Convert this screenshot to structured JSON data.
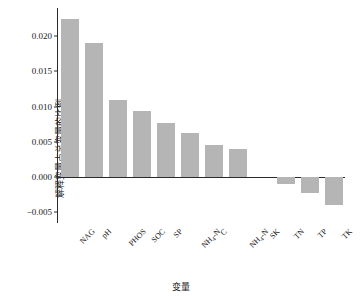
{
  "chart_data": {
    "type": "bar",
    "title": "",
    "xlabel": "变量",
    "ylabel": "解释变量占总变量的比例",
    "categories": [
      "NAG",
      "pH",
      "PHOS",
      "SOC",
      "SP",
      "NH4-N",
      "C",
      "NH4-N",
      "SK",
      "TN",
      "TP",
      "TK"
    ],
    "category_labels": [
      {
        "main": "NAG",
        "sub": ""
      },
      {
        "main": "pH",
        "sub": ""
      },
      {
        "main": "PHOS",
        "sub": ""
      },
      {
        "main": "SOC",
        "sub": ""
      },
      {
        "main": "SP",
        "sub": ""
      },
      {
        "main": "NH",
        "sub": "4",
        "tail": "-N"
      },
      {
        "main": "C",
        "sub": ""
      },
      {
        "main": "NH",
        "sub": "4",
        "tail": "-N"
      },
      {
        "main": "SK",
        "sub": ""
      },
      {
        "main": "TN",
        "sub": ""
      },
      {
        "main": "TP",
        "sub": ""
      },
      {
        "main": "TK",
        "sub": ""
      }
    ],
    "values": [
      0.0225,
      0.019,
      0.011,
      0.0094,
      0.0077,
      0.0063,
      0.0046,
      0.004,
      0.0,
      -0.001,
      -0.0023,
      -0.004
    ],
    "ylim": [
      -0.0065,
      0.024
    ],
    "yticks": [
      0.02,
      0.015,
      0.01,
      0.005,
      0.0,
      -0.005
    ],
    "ytick_labels": [
      "0.020",
      "0.015",
      "0.010",
      "0.005",
      "0.000",
      "−0.005"
    ],
    "grid": false,
    "legend": "none",
    "bar_color": "#b5b5b5",
    "axis_color": "#2b2b2b"
  }
}
